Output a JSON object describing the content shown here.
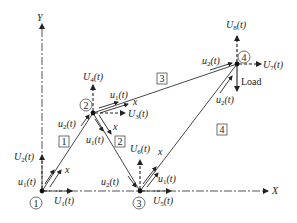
{
  "figure": {
    "axes": {
      "x_label": "X",
      "y_label": "Y"
    },
    "nodes": [
      {
        "id": "1",
        "x": 42,
        "y": 191
      },
      {
        "id": "2",
        "x": 93,
        "y": 113
      },
      {
        "id": "3",
        "x": 140,
        "y": 191
      },
      {
        "id": "4",
        "x": 237,
        "y": 64
      }
    ],
    "elements": [
      {
        "id": "1",
        "from": "1",
        "to": "2"
      },
      {
        "id": "2",
        "from": "2",
        "to": "3"
      },
      {
        "id": "3",
        "from": "2",
        "to": "4"
      },
      {
        "id": "4",
        "from": "3",
        "to": "4"
      }
    ],
    "global_dofs": {
      "U1": "U1(t)",
      "U2": "U2(t)",
      "U3": "U3(t)",
      "U4": "U4(t)",
      "U5": "U5(t)",
      "U6": "U6(t)",
      "U7": "U7(t)",
      "U8": "U8(t)"
    },
    "local_dofs": {
      "u1": "u1(t)",
      "u2": "u2(t)",
      "local_axis": "x"
    },
    "load_label": "Load"
  },
  "text": {
    "U": "U",
    "u": "u",
    "t_suffix": "(t)",
    "sub1": "1",
    "sub2": "2",
    "sub3": "3",
    "sub4": "4",
    "sub5": "5",
    "sub6": "6",
    "sub7": "7",
    "sub8": "8",
    "x_axis": "X",
    "y_axis": "Y",
    "x_local": "x",
    "load": "Load",
    "n1": "1",
    "n2": "2",
    "n3": "3",
    "n4": "4",
    "e1": "1",
    "e2": "2",
    "e3": "3",
    "e4": "4"
  }
}
